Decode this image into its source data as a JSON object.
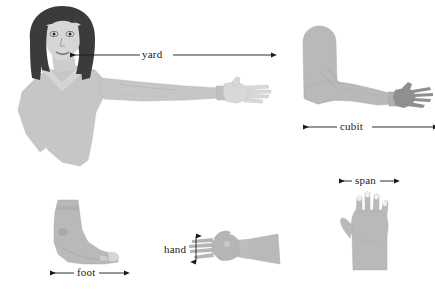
{
  "figure": {
    "width": 435,
    "height": 290,
    "background": "#ffffff"
  },
  "colors": {
    "skin_light": "#d2d2d2",
    "skin_mid": "#bdbdbd",
    "skin_dark": "#8f8f8f",
    "shirt": "#c6c6c6",
    "hair": "#3c3a3a",
    "face": "#d8d6d4",
    "outline": "#8a8a8a",
    "annotation": "#1a1a1a",
    "nail": "#eeeeee"
  },
  "measures": [
    {
      "id": "yard",
      "label": "yard",
      "arrow_style": "single-double-ended",
      "orientation": "horizontal",
      "description": "Distance from nose to fingertips of outstretched arm"
    },
    {
      "id": "cubit",
      "label": "cubit",
      "arrow_style": "double-ended",
      "orientation": "horizontal",
      "description": "Length of forearm from elbow to fingertips"
    },
    {
      "id": "span",
      "label": "span",
      "arrow_style": "double-ended",
      "orientation": "horizontal",
      "description": "Width of an outspread hand"
    },
    {
      "id": "foot",
      "label": "foot",
      "arrow_style": "double-ended",
      "orientation": "horizontal",
      "description": "Length of a foot"
    },
    {
      "id": "hand",
      "label": "hand",
      "arrow_style": "double-ended",
      "orientation": "vertical",
      "description": "Width of a hand across the palm"
    }
  ],
  "figures": [
    {
      "id": "woman",
      "name": "woman-with-outstretched-arm"
    },
    {
      "id": "bent-arm",
      "name": "bent-arm-forearm"
    },
    {
      "id": "foot",
      "name": "bare-foot-profile"
    },
    {
      "id": "hand-side",
      "name": "hand-and-forearm-side"
    },
    {
      "id": "hand-open",
      "name": "open-hand-palm"
    }
  ]
}
